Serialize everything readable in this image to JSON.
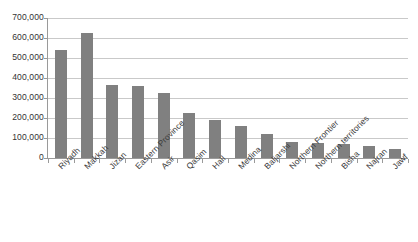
{
  "chart_data": {
    "type": "bar",
    "title": "",
    "subtitle": "",
    "xlabel": "",
    "ylabel": "",
    "grid": true,
    "legend": false,
    "legend_position": "none",
    "bar_color": "#808080",
    "gridline_color": "#c9c9c9",
    "axis_color": "#9a9a9a",
    "background_color": "#ffffff",
    "ylim": [
      0,
      700000
    ],
    "ytick_step": 100000,
    "ytick_labels": [
      "700,000",
      "600,000",
      "500,000",
      "400,000",
      "300,000",
      "200,000",
      "100,000",
      "0"
    ],
    "ytick_values": [
      700000,
      600000,
      500000,
      400000,
      300000,
      200000,
      100000,
      0
    ],
    "categories": [
      "Riyadh",
      "Makkah",
      "Jizan",
      "Eastern Province",
      "Asir",
      "Qasim",
      "Hail",
      "Medina",
      "Baljarshi",
      "Northern Frontier",
      "Northern territories",
      "Bisha",
      "Najran",
      "Jawf"
    ],
    "values": [
      538000,
      625000,
      365000,
      360000,
      325000,
      223000,
      190000,
      160000,
      120000,
      80000,
      77000,
      72000,
      60000,
      45000
    ]
  }
}
